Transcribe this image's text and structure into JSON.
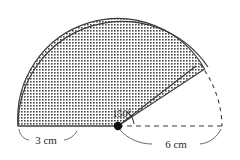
{
  "figure": {
    "type": "geometry-diagram",
    "background_color": "#ffffff",
    "stroke_color": "#3a3a3a",
    "shade_color": "#4a4a4a",
    "labels": {
      "left_radius": "3 cm",
      "angle": "150°",
      "right_radius": "6 cm"
    },
    "geometry": {
      "center_x": 118,
      "center_y": 126,
      "large_radius": 104,
      "small_radius": 100,
      "sector_angle_degrees": 150,
      "left_endpoint_x": 18,
      "left_endpoint_y": 126,
      "right_endpoint_x": 196,
      "right_endpoint_y": 66,
      "dashed_end_x": 222,
      "dashed_end_y": 126
    }
  }
}
